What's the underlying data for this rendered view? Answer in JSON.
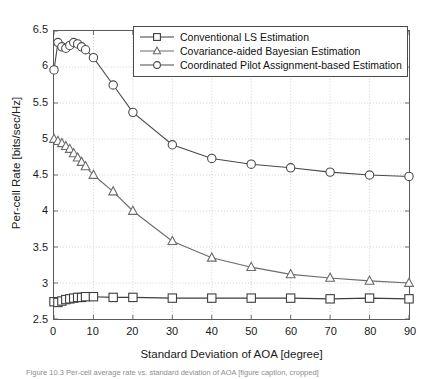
{
  "figure": {
    "caption": "Figure 10.3  Per-cell average rate vs. standard deviation of AOA [figure caption, cropped]"
  },
  "legend": {
    "position": "top-right-inside",
    "entries": [
      {
        "label": "Conventional LS Estimation",
        "marker": "square",
        "color": "#3d3d3d"
      },
      {
        "label": "Covariance-aided Bayesian Estimation",
        "marker": "triangle",
        "color": "#6b6b6b"
      },
      {
        "label": "Coordinated Pilot Assignment-based Estimation",
        "marker": "circle",
        "color": "#4a4a4a"
      }
    ]
  },
  "chart_data": {
    "type": "line",
    "title": "",
    "xlabel": "Standard Deviation of AOA [degree]",
    "ylabel": "Per-cell Rate [bits/sec/Hz]",
    "xlim": [
      0,
      90
    ],
    "ylim": [
      2.5,
      6.5
    ],
    "xticks": [
      0,
      10,
      20,
      30,
      40,
      50,
      60,
      70,
      80,
      90
    ],
    "yticks": [
      2.5,
      3,
      3.5,
      4,
      4.5,
      5,
      5.5,
      6,
      6.5
    ],
    "xtick_labels": [
      "0",
      "10",
      "20",
      "30",
      "40",
      "50",
      "60",
      "70",
      "80",
      "90"
    ],
    "ytick_labels": [
      "2.5",
      "3",
      "3.5",
      "4",
      "4.5",
      "5",
      "5.5",
      "6",
      "6.5"
    ],
    "grid": true,
    "grid_style": "dotted",
    "series": [
      {
        "name": "Coordinated Pilot Assignment-based Estimation",
        "marker": "circle",
        "color": "#4a4a4a",
        "x": [
          0,
          1,
          2,
          3,
          4,
          5,
          6,
          7,
          8,
          10,
          15,
          20,
          30,
          40,
          50,
          60,
          70,
          80,
          90
        ],
        "y": [
          5.96,
          6.34,
          6.28,
          6.26,
          6.3,
          6.34,
          6.32,
          6.28,
          6.24,
          6.13,
          5.75,
          5.37,
          4.92,
          4.73,
          4.65,
          4.6,
          4.54,
          4.5,
          4.48
        ]
      },
      {
        "name": "Covariance-aided Bayesian Estimation",
        "marker": "triangle",
        "color": "#6b6b6b",
        "x": [
          0,
          1,
          2,
          3,
          4,
          5,
          6,
          7,
          8,
          10,
          15,
          20,
          30,
          40,
          50,
          60,
          70,
          80,
          90
        ],
        "y": [
          5.0,
          4.97,
          4.94,
          4.9,
          4.86,
          4.8,
          4.74,
          4.68,
          4.62,
          4.5,
          4.27,
          4.0,
          3.58,
          3.35,
          3.22,
          3.12,
          3.07,
          3.03,
          3.0
        ]
      },
      {
        "name": "Conventional LS Estimation",
        "marker": "square",
        "color": "#3d3d3d",
        "x": [
          0,
          1,
          2,
          3,
          4,
          5,
          6,
          7,
          8,
          10,
          15,
          20,
          30,
          40,
          50,
          60,
          70,
          80,
          90
        ],
        "y": [
          2.74,
          2.73,
          2.75,
          2.77,
          2.78,
          2.79,
          2.8,
          2.8,
          2.81,
          2.81,
          2.8,
          2.8,
          2.79,
          2.79,
          2.79,
          2.79,
          2.78,
          2.79,
          2.78
        ]
      }
    ]
  }
}
